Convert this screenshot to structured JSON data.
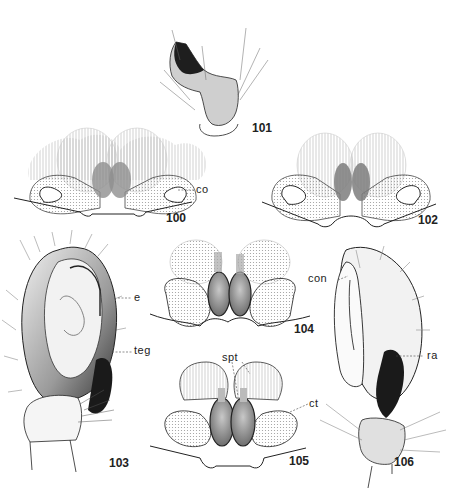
{
  "figures": [
    {
      "id": "101",
      "label": "101",
      "description": "palp, retrolateral tibial apophysis (male)"
    },
    {
      "id": "100",
      "label": "100",
      "description": "epigyne, ventral view"
    },
    {
      "id": "102",
      "label": "102",
      "description": "epigyne, ventral view"
    },
    {
      "id": "103",
      "label": "103",
      "description": "male palp, ventral view"
    },
    {
      "id": "104",
      "label": "104",
      "description": "vulva, dorsal view"
    },
    {
      "id": "105",
      "label": "105",
      "description": "vulva, dorsal view"
    },
    {
      "id": "106",
      "label": "106",
      "description": "male palp, retrolateral view"
    }
  ],
  "annotations": {
    "co": "co",
    "e": "e",
    "teg": "teg",
    "con": "con",
    "ra": "ra",
    "spt": "spt",
    "ct": "ct"
  },
  "colors": {
    "ink": "#222222",
    "stipple_light": "#d8d8d8",
    "stipple_mid": "#a8a8a8",
    "spermatheca": "#8a8a8a",
    "dark_fill": "#1a1a1a"
  }
}
